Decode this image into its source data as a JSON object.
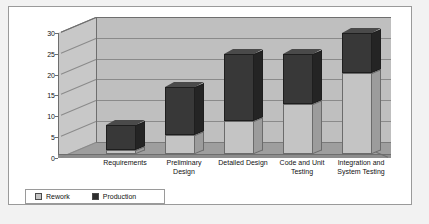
{
  "chart_data": {
    "type": "bar",
    "subtype": "stacked-column-3d",
    "title": "",
    "xlabel": "",
    "ylabel": "",
    "ylim": [
      0,
      30
    ],
    "yticks": [
      0,
      5,
      10,
      15,
      20,
      25,
      30
    ],
    "grid": true,
    "legend_position": "bottom-left",
    "categories": [
      "Requirements",
      "Preliminary Design",
      "Detailed Design",
      "Code and Unit Testing",
      "Integration and System Testing"
    ],
    "series": [
      {
        "name": "Rework",
        "color": "#c4c4c4",
        "values": [
          1,
          4.5,
          8,
          12,
          19.5
        ]
      },
      {
        "name": "Production",
        "color": "#383838",
        "values": [
          6,
          11.5,
          16,
          12,
          9.5
        ]
      }
    ],
    "totals": [
      7,
      16,
      24,
      24,
      29
    ]
  },
  "axis": {
    "tick_0": "0",
    "tick_5": "5",
    "tick_10": "10",
    "tick_15": "15",
    "tick_20": "20",
    "tick_25": "25",
    "tick_30": "30"
  },
  "categories_display": [
    {
      "line1": "Requirements",
      "line2": ""
    },
    {
      "line1": "Preliminary",
      "line2": "Design"
    },
    {
      "line1": "Detailed Design",
      "line2": ""
    },
    {
      "line1": "Code and Unit",
      "line2": "Testing"
    },
    {
      "line1": "Integration and",
      "line2": "System Testing"
    }
  ],
  "legend": {
    "items": [
      {
        "label": "Rework"
      },
      {
        "label": "Production"
      }
    ]
  }
}
